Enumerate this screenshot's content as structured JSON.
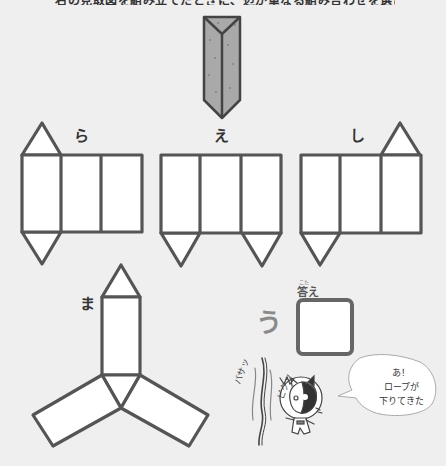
{
  "header": {
    "instruction_text_cut_off": "右の見取図を組み立てたときに、辺が重なる組み合わせを選びましょう。"
  },
  "prism": {
    "name": "triangular-prism",
    "fill": "#a9a9a9",
    "stroke": "#444444"
  },
  "nets": [
    {
      "id": "ra",
      "label": "ら"
    },
    {
      "id": "e",
      "label": "え"
    },
    {
      "id": "shi",
      "label": "し"
    },
    {
      "id": "ma",
      "label": "ま"
    }
  ],
  "answer": {
    "heading": "答え",
    "heading_furigana": "こた",
    "hint_character": "う",
    "value": ""
  },
  "speech_bubble": {
    "lines": [
      "あ！",
      "ロープが",
      "下りてきた"
    ],
    "furigana": "お"
  },
  "sound_effects": [
    "バサッ",
    "ビクッ"
  ],
  "colors": {
    "background": "#efefef",
    "outline": "#555555",
    "face_fill": "#ffffff",
    "prism_fill": "#a9a9a9"
  }
}
